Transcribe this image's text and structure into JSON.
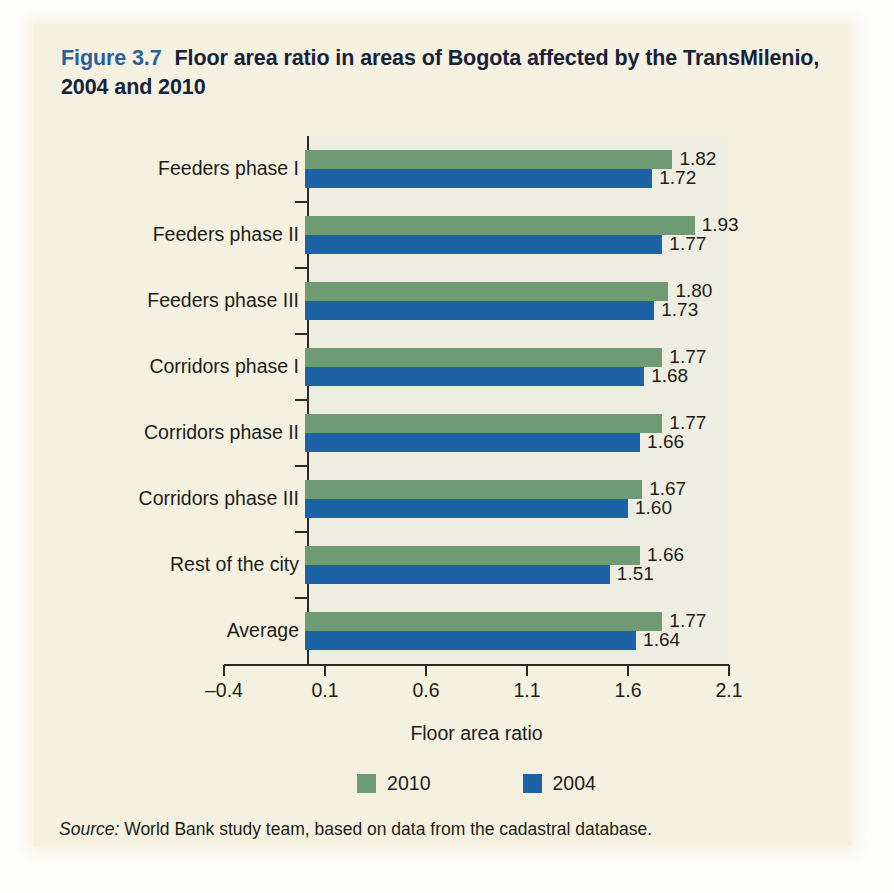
{
  "figure": {
    "number": "Figure 3.7",
    "title": "Floor area ratio in areas of Bogota affected by the TransMilenio, 2004 and 2010",
    "title_line1": "Floor area ratio in areas of Bogota affected by the",
    "title_line2": "TransMilenio, 2004 and 2010",
    "number_color": "#2b5e9e",
    "title_color": "#17223b",
    "panel_background": "#f5f1e0",
    "plot_background": "#edeee1"
  },
  "source": {
    "keyword": "Source:",
    "text": " World Bank study team, based on data from the cadastral database."
  },
  "legend": {
    "position": "bottom-center",
    "items": [
      {
        "label": "2010",
        "color": "#6e9b74"
      },
      {
        "label": "2004",
        "color": "#1e62a6"
      }
    ]
  },
  "chart_data": {
    "type": "bar",
    "orientation": "horizontal",
    "title": "Floor area ratio in areas of Bogota affected by the TransMilenio, 2004 and 2010",
    "xlabel": "Floor area ratio",
    "ylabel": "",
    "xlim": [
      -0.4,
      2.1
    ],
    "xticks": [
      "–0.4",
      "0.1",
      "0.6",
      "1.1",
      "1.6",
      "2.1"
    ],
    "xtick_values": [
      -0.4,
      0.1,
      0.6,
      1.1,
      1.6,
      2.1
    ],
    "grid": false,
    "categories": [
      "Feeders phase I",
      "Feeders phase II",
      "Feeders phase III",
      "Corridors phase I",
      "Corridors phase II",
      "Corridors phase III",
      "Rest of the city",
      "Average"
    ],
    "series": [
      {
        "name": "2010",
        "color": "#6e9b74",
        "values": [
          1.82,
          1.93,
          1.8,
          1.77,
          1.77,
          1.67,
          1.66,
          1.77
        ],
        "labels": [
          "1.82",
          "1.93",
          "1.80",
          "1.77",
          "1.77",
          "1.67",
          "1.66",
          "1.77"
        ]
      },
      {
        "name": "2004",
        "color": "#1e62a6",
        "values": [
          1.72,
          1.77,
          1.73,
          1.68,
          1.66,
          1.6,
          1.51,
          1.64
        ],
        "labels": [
          "1.72",
          "1.77",
          "1.73",
          "1.68",
          "1.66",
          "1.60",
          "1.51",
          "1.64"
        ]
      }
    ]
  }
}
